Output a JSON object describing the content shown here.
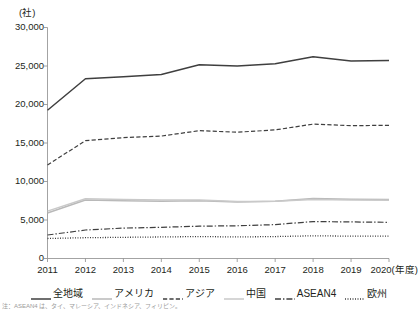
{
  "chart_data": {
    "type": "line",
    "title": "",
    "xlabel": "(年度)",
    "ylabel": "(社)",
    "y_unit_label": "(社)",
    "x_axis_suffix": "(年度)",
    "categories": [
      "2011",
      "2012",
      "2013",
      "2014",
      "2015",
      "2016",
      "2017",
      "2018",
      "2019",
      "2020"
    ],
    "ylim": [
      0,
      30000
    ],
    "yticks": [
      0,
      5000,
      10000,
      15000,
      20000,
      25000,
      30000
    ],
    "ytick_labels": [
      "0",
      "5,000",
      "10,000",
      "15,000",
      "20,000",
      "25,000",
      "30,000"
    ],
    "grid": false,
    "legend_position": "bottom",
    "series": [
      {
        "name": "全地域",
        "style": "solid",
        "color": "#3f3f3f",
        "width": 1.5,
        "values": [
          19250,
          23350,
          23600,
          23900,
          25150,
          25000,
          25300,
          26200,
          25650,
          25700
        ]
      },
      {
        "name": "アメリカ",
        "style": "solid",
        "color": "#b9b9b9",
        "width": 1.5,
        "values": [
          5900,
          7600,
          7500,
          7450,
          7500,
          7350,
          7450,
          7800,
          7700,
          7650
        ]
      },
      {
        "name": "アジア",
        "style": "dashed",
        "color": "#3f3f3f",
        "width": 1.2,
        "values": [
          12150,
          15300,
          15700,
          15900,
          16600,
          16400,
          16700,
          17450,
          17250,
          17300
        ]
      },
      {
        "name": "中国",
        "style": "solid",
        "color": "#c9c9c9",
        "width": 1.5,
        "values": [
          6150,
          7750,
          7650,
          7600,
          7600,
          7400,
          7450,
          7650,
          7600,
          7550
        ]
      },
      {
        "name": "ASEAN4",
        "style": "dashdot",
        "color": "#3f3f3f",
        "width": 1.2,
        "values": [
          3050,
          3700,
          3950,
          4050,
          4200,
          4250,
          4400,
          4800,
          4750,
          4700
        ]
      },
      {
        "name": "欧州",
        "style": "dotted",
        "color": "#3f3f3f",
        "width": 1.3,
        "values": [
          2600,
          2700,
          2750,
          2800,
          2850,
          2800,
          2850,
          2950,
          2900,
          2900
        ]
      }
    ]
  },
  "axes": {
    "y_unit": "(社)",
    "ytick_labels": [
      "30,000",
      "25,000",
      "20,000",
      "15,000",
      "10,000",
      "5,000",
      "0"
    ],
    "xtick_labels": [
      "2011",
      "2012",
      "2013",
      "2014",
      "2015",
      "2016",
      "2017",
      "2018",
      "2019",
      "2020"
    ],
    "x_last_suffix": "(年度)"
  },
  "legend": {
    "items": [
      {
        "label": "全地域"
      },
      {
        "label": "アメリカ"
      },
      {
        "label": "アジア"
      },
      {
        "label": "中国"
      },
      {
        "label": "ASEAN4"
      },
      {
        "label": "欧州"
      }
    ]
  },
  "footnote": {
    "text": "注：ASEAN4 は、タイ、マレーシア、インドネシア、フィリピン。"
  },
  "colors": {
    "ink": "#231f20",
    "axis": "#8c8c8c",
    "dark_line": "#3f3f3f",
    "gray_line": "#b9b9b9",
    "light_gray_line": "#c9c9c9",
    "background": "#ffffff"
  }
}
